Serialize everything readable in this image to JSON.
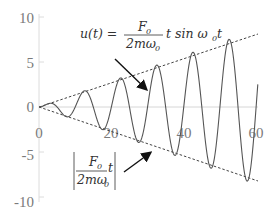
{
  "chart_data": {
    "type": "line",
    "title": "",
    "xlabel": "",
    "ylabel": "",
    "xlim": [
      0,
      60
    ],
    "ylim": [
      -10,
      10
    ],
    "x_ticks": [
      "0",
      "20",
      "40",
      "60"
    ],
    "y_ticks": [
      "10",
      "5",
      "0",
      "-5",
      "-10"
    ],
    "grid": false,
    "legend": null,
    "series": [
      {
        "name": "u(t) = F0/(2m·ω0) · t · sin(ω0 t)",
        "style": "solid",
        "formula": {
          "amplitude_slope": 0.143,
          "omega": 0.628
        },
        "x": [
          0,
          5,
          10,
          15,
          20,
          25,
          30,
          35,
          40,
          45,
          50,
          55,
          60
        ],
        "peaks": [
          [
            5,
            0.7
          ],
          [
            15,
            2.1
          ],
          [
            25,
            3.6
          ],
          [
            35,
            5.0
          ],
          [
            45,
            6.4
          ],
          [
            55,
            7.9
          ]
        ],
        "troughs": [
          [
            10,
            -1.4
          ],
          [
            20,
            -2.9
          ],
          [
            30,
            -4.3
          ],
          [
            40,
            -5.7
          ],
          [
            50,
            -7.1
          ],
          [
            60,
            -8.6
          ]
        ]
      },
      {
        "name": "+|F0/(2m·ω0)| t envelope",
        "style": "dashed",
        "x": [
          0,
          60
        ],
        "values": [
          0,
          8.6
        ]
      },
      {
        "name": "-|F0/(2m·ω0)| t envelope",
        "style": "dashed",
        "x": [
          0,
          60
        ],
        "values": [
          0,
          -8.6
        ]
      }
    ],
    "annotations": [
      {
        "text": "u(t) = F0/(2mω0) t sin ω0t",
        "arrow_to": "curve near t≈30"
      },
      {
        "text": "|F0/(2mω0)| t",
        "arrow_to": "lower envelope near t≈36"
      }
    ]
  },
  "labels": {
    "y_ticks": [
      "10",
      "5",
      "0",
      "-5",
      "-10"
    ],
    "x_ticks": [
      "0",
      "20",
      "40",
      "60"
    ],
    "eq_top": {
      "lhs": "u(t) =",
      "num": "F",
      "num_sub": "0",
      "den": "2mω",
      "den_sub": "0",
      "rhs": "t sin ω",
      "rhs_sub": "0",
      "rhs_end": "t"
    },
    "eq_bottom": {
      "num": "F",
      "num_sub": "0",
      "den": "2mω",
      "den_sub": "0",
      "rhs": "t"
    }
  },
  "colors": {
    "curve": "#555555",
    "envelope": "#444444",
    "axis": "#d0d0d0",
    "tick_label": "#7a7a7a",
    "arrow": "#111111"
  }
}
